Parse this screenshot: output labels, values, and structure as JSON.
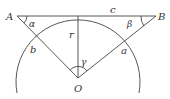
{
  "diagram": {
    "points": {
      "A": {
        "label": "A"
      },
      "B": {
        "label": "B"
      },
      "O": {
        "label": "O"
      }
    },
    "segments": {
      "c": {
        "label": "c"
      },
      "r": {
        "label": "r"
      },
      "a": {
        "label": "a"
      },
      "b": {
        "label": "b"
      }
    },
    "angles": {
      "alpha": {
        "label": "α"
      },
      "beta": {
        "label": "β"
      },
      "gamma": {
        "label": "γ"
      }
    },
    "colors": {
      "line": "#444444",
      "text": "#333333",
      "background": "#ffffff"
    }
  }
}
